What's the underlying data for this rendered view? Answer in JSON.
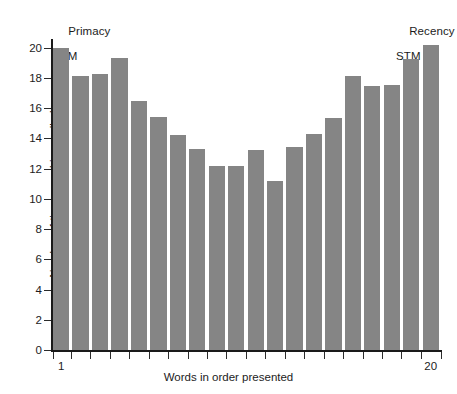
{
  "chart_data": {
    "type": "bar",
    "title": "",
    "subtitle": "",
    "xlabel": "Words in order presented",
    "ylabel": "Number of times word is recalled",
    "categories": [
      "1",
      "2",
      "3",
      "4",
      "5",
      "6",
      "7",
      "8",
      "9",
      "10",
      "11",
      "12",
      "13",
      "14",
      "15",
      "16",
      "17",
      "18",
      "19",
      "20"
    ],
    "values": [
      20.0,
      18.15,
      18.25,
      19.3,
      16.5,
      15.4,
      14.25,
      13.3,
      12.2,
      12.2,
      13.2,
      11.2,
      13.45,
      14.3,
      15.35,
      18.15,
      17.45,
      17.5,
      19.25,
      20.2
    ],
    "series": [
      {
        "name": "Number of times word is recalled",
        "values": [
          20.0,
          18.15,
          18.25,
          19.3,
          16.5,
          15.4,
          14.25,
          13.3,
          12.2,
          12.2,
          13.2,
          11.2,
          13.45,
          14.3,
          15.35,
          18.15,
          17.45,
          17.5,
          19.25,
          20.2
        ]
      }
    ],
    "ylim": [
      0,
      20.5
    ],
    "xlim": [
      0.5,
      20.5
    ],
    "y_ticks": [
      0,
      2,
      4,
      6,
      8,
      10,
      12,
      14,
      16,
      18,
      20
    ],
    "y_tick_labels": [
      "0",
      "2",
      "4",
      "6",
      "8",
      "10",
      "12",
      "14",
      "16",
      "18",
      "20"
    ],
    "x_tick_labels_shown": [
      "1",
      "20"
    ],
    "x_tick_label_positions": [
      1,
      20
    ],
    "grid": false,
    "legend": false,
    "legend_position": "none",
    "bar_color": "#858585",
    "axis_color": "#1a1a1a",
    "text_color": "#1c1c1c",
    "background": "#ffffff",
    "annotations": [
      {
        "name": "primacy",
        "line1": "Primacy",
        "line2": "LTM",
        "anchor_bar": 1
      },
      {
        "name": "recency",
        "line1": "Recency",
        "line2": "STM",
        "anchor_bar": 20
      }
    ]
  }
}
